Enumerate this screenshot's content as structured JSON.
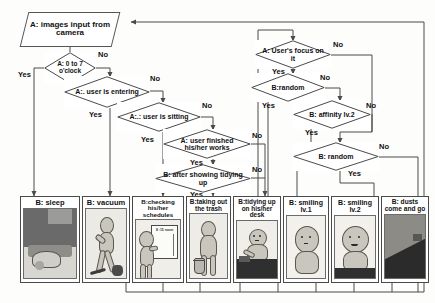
{
  "diagram": {
    "start_node": {
      "prefix": "A:",
      "label": "images input from camera",
      "shape": "parallelogram"
    },
    "decisions": [
      {
        "id": "clock",
        "prefix": "A:",
        "label": "0 to 7 o'clock"
      },
      {
        "id": "entering",
        "prefix": "A:.",
        "label": "user is entering"
      },
      {
        "id": "sitting",
        "prefix": "A:.:",
        "label": "user is sitting"
      },
      {
        "id": "finished",
        "prefix": "A:",
        "label": "user finished his/her works"
      },
      {
        "id": "tidying",
        "prefix": "B:",
        "label": "after showing tidying up"
      },
      {
        "id": "focus",
        "prefix": "A:",
        "label": "User's focus on it"
      },
      {
        "id": "random1",
        "prefix": "B:",
        "label": "random"
      },
      {
        "id": "affinity",
        "prefix": "B:",
        "label": "affinity lv.2"
      },
      {
        "id": "random2",
        "prefix": "B:",
        "label": "random"
      }
    ],
    "edge_labels": {
      "yes": "Yes",
      "no": "No"
    },
    "panels": [
      {
        "id": "sleep",
        "caption": "B: sleep"
      },
      {
        "id": "vacuum",
        "caption": "B: vacuum"
      },
      {
        "id": "schedules",
        "caption": "B:checking his/her schedules"
      },
      {
        "id": "trash",
        "caption": "B:taking out the trash"
      },
      {
        "id": "desk",
        "caption": "B:tidying up on his/her desk"
      },
      {
        "id": "smile1",
        "caption": "B: smiling lv.1"
      },
      {
        "id": "smile2",
        "caption": "B: smiling lv.2"
      },
      {
        "id": "dusts",
        "caption": "B: dusts come and go"
      }
    ],
    "panel_detail": {
      "schedule_board_label": "8 :15 room"
    },
    "colors": {
      "line": "#4a4a4a",
      "text": "#111111",
      "node_fill": "#ffffff",
      "panel_border": "#4a4a4a"
    }
  }
}
